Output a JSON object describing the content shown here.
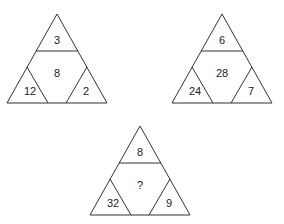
{
  "puzzle": {
    "triangles": [
      {
        "top": "3",
        "center": "8",
        "left": "12",
        "right": "2"
      },
      {
        "top": "6",
        "center": "28",
        "left": "24",
        "right": "7"
      },
      {
        "top": "8",
        "center": "?",
        "left": "32",
        "right": "9"
      }
    ]
  }
}
